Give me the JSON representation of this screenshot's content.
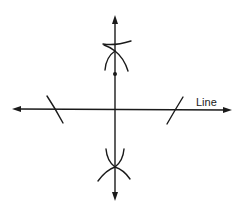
{
  "diagram": {
    "labels": {
      "line_label": "Line"
    },
    "colors": {
      "ink": "#1a1a1a",
      "background": "#ffffff"
    },
    "elements": {
      "horizontal_line": {
        "x1": 12,
        "y1": 109,
        "x2": 232,
        "y2": 110,
        "arrows": "both"
      },
      "vertical_line": {
        "x1": 115,
        "y1": 15,
        "x2": 115,
        "y2": 200,
        "arrows": "both"
      },
      "point_on_perpendicular": {
        "cx": 115,
        "cy": 74
      },
      "top_intersection": {
        "cx": 115,
        "cy": 51
      },
      "bottom_intersection": {
        "cx": 115,
        "cy": 167
      },
      "left_arc_on_line": {
        "cx": 55,
        "cy": 109
      },
      "right_arc_on_line": {
        "cx": 175,
        "cy": 110
      }
    }
  }
}
